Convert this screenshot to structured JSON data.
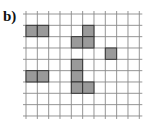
{
  "label": "b)",
  "grid": {
    "origin_x": 26,
    "origin_y": 14,
    "cell": 11.33,
    "cols": 10,
    "rows": 9,
    "extend": 3,
    "line_color": "#8a8a8a",
    "fill_color": "#9a9a9a",
    "cell_border_color": "#333333"
  },
  "shaded_cells": [
    {
      "col": 0,
      "row": 1
    },
    {
      "col": 1,
      "row": 1
    },
    {
      "col": 5,
      "row": 1
    },
    {
      "col": 4,
      "row": 2
    },
    {
      "col": 5,
      "row": 2
    },
    {
      "col": 7,
      "row": 3
    },
    {
      "col": 4,
      "row": 4
    },
    {
      "col": 0,
      "row": 5
    },
    {
      "col": 1,
      "row": 5
    },
    {
      "col": 4,
      "row": 5
    },
    {
      "col": 4,
      "row": 6
    },
    {
      "col": 5,
      "row": 6
    }
  ]
}
